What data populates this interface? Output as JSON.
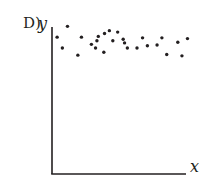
{
  "panel_label": "D)",
  "chart_data": {
    "type": "scatter",
    "title": "",
    "xlabel": "x",
    "ylabel": "y",
    "grid": false,
    "legend": null,
    "tick_labels": {
      "x": [],
      "y": []
    },
    "xlim": [
      0,
      10
    ],
    "ylim": [
      0,
      10
    ],
    "points": [
      {
        "x": 0.37,
        "y": 9.5
      },
      {
        "x": 1.12,
        "y": 10.25
      },
      {
        "x": 0.75,
        "y": 8.75
      },
      {
        "x": 2.13,
        "y": 9.5
      },
      {
        "x": 1.87,
        "y": 8.25
      },
      {
        "x": 2.85,
        "y": 9.0
      },
      {
        "x": 3.25,
        "y": 9.25
      },
      {
        "x": 3.15,
        "y": 8.75
      },
      {
        "x": 3.35,
        "y": 9.55
      },
      {
        "x": 3.8,
        "y": 9.75
      },
      {
        "x": 4.15,
        "y": 9.95
      },
      {
        "x": 4.4,
        "y": 9.25
      },
      {
        "x": 4.75,
        "y": 9.85
      },
      {
        "x": 3.75,
        "y": 8.45
      },
      {
        "x": 5.15,
        "y": 9.35
      },
      {
        "x": 5.25,
        "y": 9.1
      },
      {
        "x": 5.45,
        "y": 8.75
      },
      {
        "x": 6.15,
        "y": 8.75
      },
      {
        "x": 6.55,
        "y": 9.45
      },
      {
        "x": 6.9,
        "y": 8.9
      },
      {
        "x": 7.6,
        "y": 8.95
      },
      {
        "x": 7.95,
        "y": 9.45
      },
      {
        "x": 8.3,
        "y": 8.3
      },
      {
        "x": 9.1,
        "y": 9.15
      },
      {
        "x": 9.4,
        "y": 8.2
      },
      {
        "x": 9.8,
        "y": 9.4
      }
    ],
    "color": "#231f20"
  }
}
